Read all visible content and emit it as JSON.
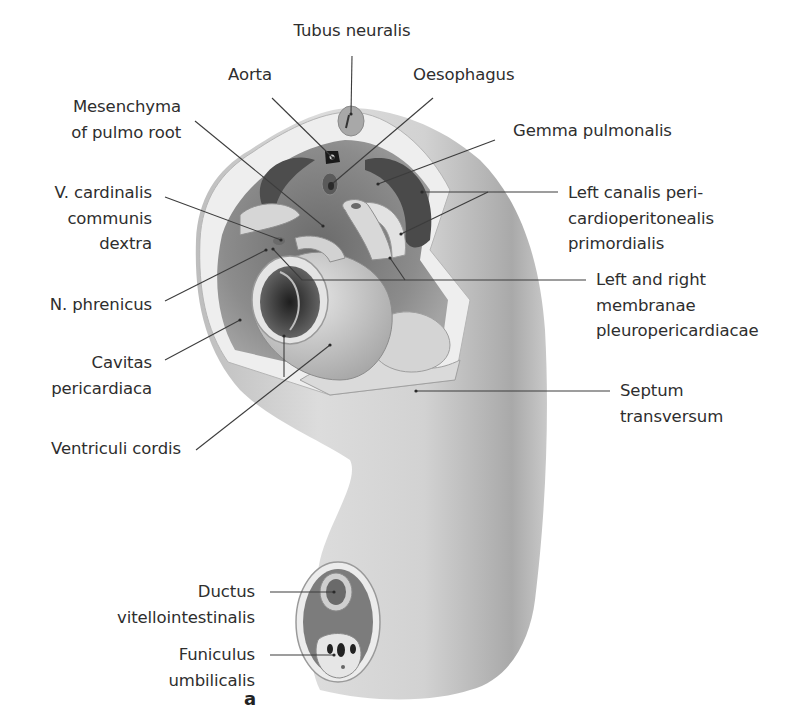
{
  "figure": {
    "panel_letter": "a",
    "colors": {
      "background": "#ffffff",
      "skin_light": "#e4e4e4",
      "skin_mid": "#c8c8c8",
      "skin_dark": "#8e8e8e",
      "cavity_dark": "#3a3a3a",
      "leader_line": "#3c3c3c",
      "text": "#2e2e2e"
    },
    "labels": {
      "tubus_neuralis": [
        "Tubus neuralis"
      ],
      "aorta": [
        "Aorta"
      ],
      "oesophagus": [
        "Oesophagus"
      ],
      "mesenchyma": [
        "Mesenchyma",
        "of pulmo root"
      ],
      "gemma_pulmonalis": [
        "Gemma pulmonalis"
      ],
      "v_cardinalis": [
        "V. cardinalis",
        "communis",
        "dextra"
      ],
      "left_canalis": [
        "Left canalis peri-",
        "cardioperitonealis",
        "primordialis"
      ],
      "membranae": [
        "Left and right",
        "membranae",
        "pleuropericardiacae"
      ],
      "n_phrenicus": [
        "N. phrenicus"
      ],
      "cavitas_pericardiaca": [
        "Cavitas",
        "pericardiaca"
      ],
      "ventriculi_cordis": [
        "Ventriculi cordis"
      ],
      "septum_transversum": [
        "Septum",
        "transversum"
      ],
      "ductus_vitellointestinalis": [
        "Ductus",
        "vitellointestinalis"
      ],
      "funiculus_umbilicalis": [
        "Funiculus",
        "umbilicalis"
      ]
    }
  }
}
